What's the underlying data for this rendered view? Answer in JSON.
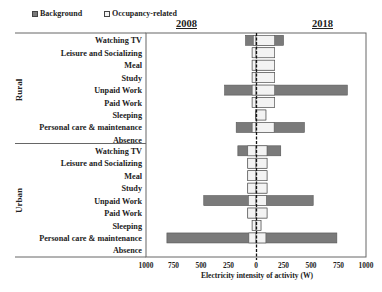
{
  "legend": {
    "background": "Background",
    "occupancy": "Occupancy-related"
  },
  "years": {
    "left": "2008",
    "right": "2018"
  },
  "colors": {
    "background": "#7a7a7a",
    "occupancy": "#f3f3f3",
    "border": "#555555"
  },
  "chart_data": {
    "type": "bar",
    "subtype": "diverging stacked horizontal bar (2008 left, 2018 right)",
    "title": "",
    "xlabel": "Electricity intensity of activity (W)",
    "ylabel": "",
    "xlim": [
      -1000,
      1000
    ],
    "x_ticks": [
      "1000",
      "750",
      "500",
      "250",
      "0",
      "250",
      "500",
      "750",
      "1000"
    ],
    "x_tick_values": [
      -1000,
      -750,
      -500,
      -250,
      0,
      250,
      500,
      750,
      1000
    ],
    "legend": [
      "Background",
      "Occupancy-related"
    ],
    "legend_position": "top-left",
    "grid": false,
    "groups": [
      {
        "name": "Rural",
        "categories": [
          "Watching TV",
          "Leisure and Socializing",
          "Meal",
          "Study",
          "Unpaid Work",
          "Paid Work",
          "Sleeping",
          "Personal care & maintenance",
          "Absence"
        ],
        "2008": {
          "occupancy": [
            25,
            35,
            35,
            35,
            35,
            35,
            5,
            35,
            0
          ],
          "total": [
            95,
            35,
            35,
            35,
            285,
            35,
            5,
            180,
            0
          ]
        },
        "2018": {
          "occupancy": [
            170,
            170,
            170,
            170,
            170,
            170,
            90,
            165,
            0
          ],
          "total": [
            250,
            170,
            170,
            170,
            830,
            170,
            90,
            440,
            0
          ]
        }
      },
      {
        "name": "Urban",
        "categories": [
          "Watching TV",
          "Leisure and Socializing",
          "Meal",
          "Study",
          "Unpaid Work",
          "Paid Work",
          "Sleeping",
          "Personal care & maintenance",
          "Absence"
        ],
        "2008": {
          "occupancy": [
            75,
            75,
            75,
            75,
            70,
            75,
            35,
            65,
            0
          ],
          "total": [
            165,
            75,
            75,
            75,
            475,
            75,
            35,
            810,
            0
          ]
        },
        "2018": {
          "occupancy": [
            100,
            100,
            100,
            100,
            95,
            100,
            45,
            90,
            0
          ],
          "total": [
            225,
            100,
            100,
            100,
            520,
            100,
            45,
            735,
            0
          ]
        }
      }
    ]
  }
}
